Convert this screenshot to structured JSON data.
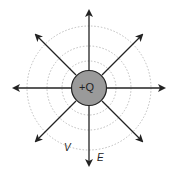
{
  "diagram": {
    "charge": {
      "label": "+Q",
      "fill": "#9a9a9a",
      "stroke": "#222222"
    },
    "labels": {
      "potential": "V",
      "field": "E"
    },
    "field_lines": {
      "count": 8,
      "directions_deg": [
        0,
        45,
        90,
        135,
        180,
        225,
        270,
        315
      ],
      "color": "#222222",
      "direction": "outward"
    },
    "equipotentials": {
      "count": 3,
      "style": "dotted",
      "color": "#b5b5b5"
    }
  }
}
